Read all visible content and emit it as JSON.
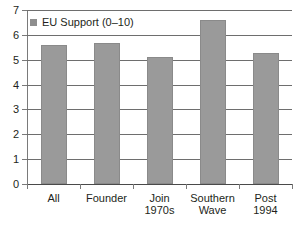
{
  "chart_data": {
    "type": "bar",
    "title": "",
    "xlabel": "",
    "ylabel": "",
    "categories": [
      "All",
      "Founder",
      "Join\n1970s",
      "Southern\nWave",
      "Post\n1994"
    ],
    "values": [
      5.6,
      5.67,
      5.12,
      6.6,
      5.27
    ],
    "series": [
      {
        "name": "EU Support (0–10)",
        "values": [
          5.6,
          5.67,
          5.12,
          6.6,
          5.27
        ]
      }
    ],
    "ylim": [
      0,
      7
    ],
    "yticks": [
      0,
      1,
      2,
      3,
      4,
      5,
      6,
      7
    ],
    "ytick_labels": [
      "0",
      "1",
      "2",
      "3",
      "4",
      "5",
      "6",
      "7"
    ],
    "grid": true,
    "legend": {
      "position": "top-left-inside",
      "entries": [
        {
          "label": "EU Support (0–10)",
          "color": "#8e8e8e"
        }
      ]
    },
    "colors": {
      "bar_fill": "#9a9a9a",
      "bar_border": "#8a8a8a",
      "gridline": "#6e6e6e",
      "axis": "#7a7a7a",
      "text": "#231f20",
      "background": "#ffffff"
    }
  }
}
